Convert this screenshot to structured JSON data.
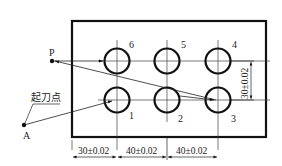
{
  "diagram": {
    "type": "cnc-drilling-path",
    "points": {
      "P": {
        "label": "P",
        "x": 52,
        "y": 61
      },
      "A": {
        "label": "A",
        "x": 24,
        "y": 125
      }
    },
    "start_point_label": "起刀点",
    "holes": [
      {
        "id": "1",
        "label": "1",
        "cx": 117,
        "cy": 100
      },
      {
        "id": "2",
        "label": "2",
        "cx": 167,
        "cy": 100
      },
      {
        "id": "3",
        "label": "3",
        "cx": 218,
        "cy": 100
      },
      {
        "id": "4",
        "label": "4",
        "cx": 218,
        "cy": 61
      },
      {
        "id": "5",
        "label": "5",
        "cx": 167,
        "cy": 61
      },
      {
        "id": "6",
        "label": "6",
        "cx": 117,
        "cy": 61
      }
    ],
    "dimensions": {
      "horizontal": [
        "30±0.02",
        "40±0.02",
        "40±0.02"
      ],
      "vertical": "30±0.02"
    },
    "colors": {
      "line": "#111111",
      "thin_line": "#333333",
      "background": "#ffffff"
    }
  }
}
